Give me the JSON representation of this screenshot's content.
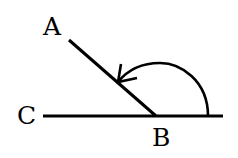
{
  "diagram": {
    "type": "angle",
    "labels": {
      "A": "A",
      "B": "B",
      "C": "C"
    },
    "points": {
      "A": [
        68,
        40
      ],
      "B": [
        156,
        116
      ],
      "C": [
        43,
        116
      ],
      "line_end_right": [
        223,
        116
      ]
    },
    "stroke_color": "#000000",
    "background": "#ffffff"
  }
}
